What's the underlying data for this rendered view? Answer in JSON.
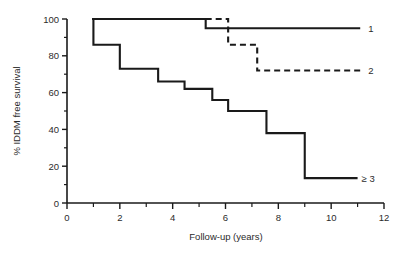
{
  "chart_data": {
    "type": "line",
    "title": "",
    "xlabel": "Follow-up (years)",
    "ylabel": "% IDDM free survival",
    "xlim": [
      0,
      12
    ],
    "ylim": [
      0,
      100
    ],
    "grid": false,
    "legend_position": "right-inline",
    "xticks": [
      0,
      2,
      4,
      6,
      8,
      10,
      12
    ],
    "xtick_labels": [
      "0",
      "2",
      "4",
      "6",
      "8",
      "10",
      "12"
    ],
    "xminor_ticks": [
      1,
      3,
      5,
      7,
      9,
      11
    ],
    "yticks": [
      0,
      20,
      40,
      60,
      80,
      100
    ],
    "ytick_labels": [
      "0",
      "20",
      "40",
      "60",
      "80",
      "100"
    ],
    "yminor_ticks": [
      10,
      30,
      50,
      70,
      90
    ],
    "series": [
      {
        "name": "1",
        "label": "1",
        "style": "solid",
        "color": "#1a1a1a",
        "label_x": 11.4,
        "label_y": 95,
        "points": [
          {
            "x": 0.95,
            "y": 100
          },
          {
            "x": 5.25,
            "y": 100
          },
          {
            "x": 5.25,
            "y": 95
          },
          {
            "x": 11.1,
            "y": 95
          }
        ]
      },
      {
        "name": "2",
        "label": "2",
        "style": "dashed",
        "color": "#1a1a1a",
        "label_x": 11.4,
        "label_y": 72,
        "points": [
          {
            "x": 5.25,
            "y": 100
          },
          {
            "x": 6.1,
            "y": 100
          },
          {
            "x": 6.1,
            "y": 86
          },
          {
            "x": 7.2,
            "y": 86
          },
          {
            "x": 7.2,
            "y": 72
          },
          {
            "x": 11.1,
            "y": 72
          }
        ]
      },
      {
        "name": "3plus",
        "label": "≥ 3",
        "style": "solid",
        "color": "#1a1a1a",
        "label_x": 11.15,
        "label_y": 13.5,
        "points": [
          {
            "x": 0.95,
            "y": 100
          },
          {
            "x": 1.0,
            "y": 100
          },
          {
            "x": 1.0,
            "y": 86
          },
          {
            "x": 2.0,
            "y": 86
          },
          {
            "x": 2.0,
            "y": 73
          },
          {
            "x": 3.45,
            "y": 73
          },
          {
            "x": 3.45,
            "y": 66
          },
          {
            "x": 4.45,
            "y": 66
          },
          {
            "x": 4.45,
            "y": 62
          },
          {
            "x": 5.5,
            "y": 62
          },
          {
            "x": 5.5,
            "y": 56
          },
          {
            "x": 6.1,
            "y": 56
          },
          {
            "x": 6.1,
            "y": 50
          },
          {
            "x": 7.55,
            "y": 50
          },
          {
            "x": 7.55,
            "y": 38
          },
          {
            "x": 9.0,
            "y": 38
          },
          {
            "x": 9.0,
            "y": 13.5
          },
          {
            "x": 11.0,
            "y": 13.5
          }
        ]
      }
    ]
  },
  "axis": {
    "line_color": "#1a1a1a"
  }
}
